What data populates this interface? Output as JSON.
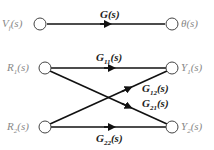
{
  "diagram": {
    "type": "signal-flow-graph",
    "top": {
      "input": "Vf(s)",
      "output": "θ(s)",
      "gain": "G(s)"
    },
    "bottom": {
      "inputs": [
        "R1(s)",
        "R2(s)"
      ],
      "outputs": [
        "Y1(s)",
        "Y2(s)"
      ],
      "gains": [
        "G11(s)",
        "G12(s)",
        "G21(s)",
        "G22(s)"
      ]
    }
  },
  "labels": {
    "vf": {
      "main": "V",
      "sub": "f",
      "rest": "(s)"
    },
    "theta": "θ(s)",
    "g": "G(s)",
    "r1": {
      "main": "R",
      "sub": "1",
      "rest": "(s)"
    },
    "r2": {
      "main": "R",
      "sub": "2",
      "rest": "(s)"
    },
    "y1": {
      "main": "Y",
      "sub": "1",
      "rest": "(s)"
    },
    "y2": {
      "main": "Y",
      "sub": "2",
      "rest": "(s)"
    },
    "g11": {
      "main": "G",
      "sub": "11",
      "rest": "(s)"
    },
    "g12": {
      "main": "G",
      "sub": "12",
      "rest": "(s)"
    },
    "g21": {
      "main": "G",
      "sub": "21",
      "rest": "(s)"
    },
    "g22": {
      "main": "G",
      "sub": "22",
      "rest": "(s)"
    }
  }
}
